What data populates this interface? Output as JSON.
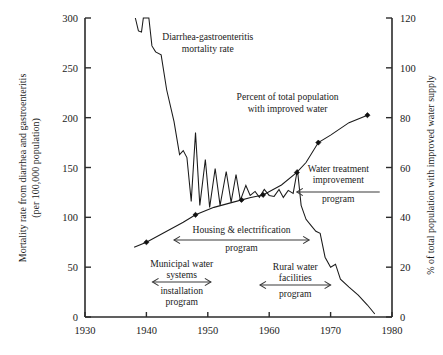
{
  "chart_data": {
    "type": "line",
    "title": "",
    "xlabel": "",
    "xlim": [
      1930,
      1980
    ],
    "xticks": [
      1930,
      1940,
      1950,
      1960,
      1970,
      1980
    ],
    "grid": false,
    "legend": "none (in-plot text annotations)",
    "axes": {
      "left": {
        "label": "Mortality rate from diarrhea and gastroenteritis (per 100,000 population)",
        "label_line1": "Mortality rate from diarrhea and gastroenteritis",
        "label_line2": "(per 100,000 population)",
        "lim": [
          0,
          300
        ],
        "ticks": [
          0,
          50,
          100,
          150,
          200,
          250,
          300
        ],
        "ticklabels": [
          "0",
          "50",
          "100",
          "150",
          "200",
          "250",
          "300"
        ]
      },
      "right": {
        "label": "% of total population with improved water supply",
        "lim": [
          0,
          120
        ],
        "ticks": [
          0,
          20,
          40,
          60,
          80,
          100,
          120
        ],
        "ticklabels": [
          "0",
          "20",
          "40",
          "60",
          "80",
          "100",
          "120"
        ]
      }
    },
    "series": [
      {
        "name": "Diarrhea-gastroenteritis mortality rate",
        "axis": "left",
        "style": "jagged line, no markers",
        "points": [
          [
            1938.2,
            300
          ],
          [
            1938.7,
            287
          ],
          [
            1939.2,
            286
          ],
          [
            1939.5,
            300
          ],
          [
            1940.4,
            300
          ],
          [
            1940.9,
            272
          ],
          [
            1941.5,
            266
          ],
          [
            1942.4,
            263
          ],
          [
            1943.3,
            228
          ],
          [
            1944.5,
            196
          ],
          [
            1945.4,
            163
          ],
          [
            1946.0,
            167
          ],
          [
            1946.6,
            160
          ],
          [
            1947.3,
            116
          ],
          [
            1948.0,
            185
          ],
          [
            1948.7,
            112
          ],
          [
            1949.6,
            158
          ],
          [
            1950.3,
            110
          ],
          [
            1951.2,
            149
          ],
          [
            1952.0,
            112
          ],
          [
            1953.0,
            146
          ],
          [
            1953.8,
            115
          ],
          [
            1954.6,
            143
          ],
          [
            1955.3,
            117
          ],
          [
            1956.2,
            132
          ],
          [
            1956.9,
            122
          ],
          [
            1957.7,
            126
          ],
          [
            1958.4,
            120
          ],
          [
            1959.2,
            128
          ],
          [
            1960.0,
            122
          ],
          [
            1960.8,
            121
          ],
          [
            1961.6,
            128
          ],
          [
            1962.3,
            120
          ],
          [
            1963.1,
            127
          ],
          [
            1963.9,
            124
          ],
          [
            1964.6,
            148
          ],
          [
            1965.2,
            112
          ],
          [
            1966.0,
            98
          ],
          [
            1966.8,
            92
          ],
          [
            1967.6,
            86
          ],
          [
            1968.3,
            84
          ],
          [
            1969.1,
            60
          ],
          [
            1970.0,
            50
          ],
          [
            1970.8,
            53
          ],
          [
            1971.6,
            38
          ],
          [
            1973.0,
            30
          ],
          [
            1974.5,
            22
          ],
          [
            1976.0,
            12
          ],
          [
            1977.2,
            3
          ]
        ]
      },
      {
        "name": "Percent of total population with improved water",
        "axis": "right",
        "style": "smooth rising line with filled diamond markers",
        "points": [
          [
            1938.0,
            28
          ],
          [
            1940.0,
            30
          ],
          [
            1943.0,
            34
          ],
          [
            1946.0,
            38
          ],
          [
            1948.0,
            41
          ],
          [
            1951.0,
            44
          ],
          [
            1954.0,
            46
          ],
          [
            1957.0,
            48
          ],
          [
            1959.0,
            49
          ],
          [
            1962.0,
            53
          ],
          [
            1964.5,
            58
          ],
          [
            1966.0,
            62
          ],
          [
            1968.0,
            70
          ],
          [
            1970.0,
            73
          ],
          [
            1973.0,
            78
          ],
          [
            1976.0,
            81
          ]
        ],
        "markers": [
          [
            1940.0,
            30
          ],
          [
            1948.0,
            41
          ],
          [
            1955.5,
            47
          ],
          [
            1959.0,
            49
          ],
          [
            1964.5,
            58
          ],
          [
            1968.0,
            70
          ],
          [
            1976.0,
            81
          ]
        ]
      }
    ],
    "annotations": [
      {
        "name": "mortality-series-label",
        "text_lines": [
          "Diarrhea-gastroenteritis",
          "mortality rate"
        ],
        "x": 1950.0,
        "y_left": 278
      },
      {
        "name": "water-series-label",
        "text_lines": [
          "Percent of total population",
          "with improved water"
        ],
        "x": 1963.0,
        "y_left": 218
      },
      {
        "name": "water-treatment-improvement-program",
        "text_lines": [
          "Water treatment",
          "improvement",
          "program"
        ],
        "arrow": "left",
        "span_years": [
          1964.5,
          1978.0
        ]
      },
      {
        "name": "housing-electrification-program",
        "text_lines": [
          "Housing & electrification",
          "program"
        ],
        "arrow": "both",
        "span_years": [
          1944.5,
          1966.5
        ]
      },
      {
        "name": "municipal-water-systems-installation-program",
        "text_lines": [
          "Municipal water",
          "systems",
          "installation",
          "program"
        ],
        "arrow": "both",
        "span_years": [
          1941.0,
          1950.5
        ]
      },
      {
        "name": "rural-water-facilities-program",
        "text_lines": [
          "Rural water",
          "facilities",
          "program"
        ],
        "arrow": "both",
        "span_years": [
          1958.5,
          1970.0
        ]
      }
    ],
    "colors": {
      "line": "#1a1a1a",
      "axis": "#2b2b2b",
      "arrow": "#3a3a3a",
      "background": "#ffffff"
    }
  }
}
